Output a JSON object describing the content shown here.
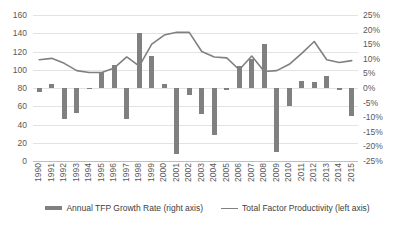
{
  "chart_data": {
    "type": "bar",
    "title": "",
    "subtitle": "",
    "xlabel": "",
    "ylabel": "",
    "grid": true,
    "legend_position": "bottom",
    "categories": [
      "1990",
      "1991",
      "1992",
      "1993",
      "1994",
      "1995",
      "1996",
      "1997",
      "1998",
      "1999",
      "2000",
      "2001",
      "2002",
      "2003",
      "2004",
      "2005",
      "2006",
      "2007",
      "2008",
      "2009",
      "2010",
      "2011",
      "2012",
      "2013",
      "2014",
      "2015"
    ],
    "left_axis": {
      "label": "Total Factor Productivity (left axis)",
      "ticks": [
        0,
        20,
        40,
        60,
        80,
        100,
        120,
        140,
        160
      ],
      "tick_labels": [
        "0",
        "20",
        "40",
        "60",
        "80",
        "100",
        "120",
        "140",
        "160"
      ],
      "ylim": [
        0,
        160
      ]
    },
    "right_axis": {
      "label": "Annual TFP Growth Rate (right axis)",
      "ticks": [
        -25,
        -20,
        -15,
        -10,
        -5,
        0,
        5,
        10,
        15,
        20,
        25
      ],
      "tick_labels": [
        "-25%",
        "-20%",
        "-15%",
        "-10%",
        "-5%",
        "0%",
        "5%",
        "10%",
        "15%",
        "20%",
        "25%"
      ],
      "ylim": [
        -25,
        25
      ]
    },
    "series": [
      {
        "name": "Annual TFP Growth Rate (right axis)",
        "type": "bar",
        "axis": "right",
        "color": "#808080",
        "values": [
          -1.3,
          1.5,
          -10.5,
          -8.5,
          -0.3,
          5.5,
          8.0,
          -10.5,
          19.0,
          11.0,
          1.5,
          -22.5,
          -2.5,
          -9.0,
          -16.0,
          -0.8,
          7.5,
          10.0,
          15.0,
          -22.0,
          -6.0,
          2.5,
          2.0,
          4.0,
          -0.5,
          -9.5
        ]
      },
      {
        "name": "Total Factor Productivity (left axis)",
        "type": "line",
        "axis": "left",
        "color": "#808080",
        "values": [
          111,
          112.5,
          107,
          99,
          97,
          97,
          102,
          114,
          104,
          128,
          138,
          141,
          141,
          120,
          114,
          113,
          100,
          115,
          98,
          99,
          106,
          118,
          131,
          111,
          108,
          110
        ]
      }
    ]
  }
}
